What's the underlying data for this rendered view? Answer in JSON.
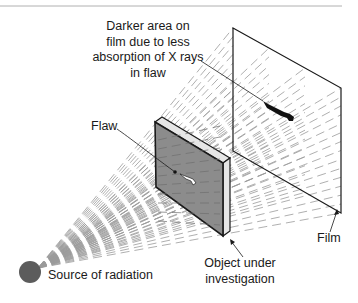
{
  "diagram": {
    "type": "radiography-schematic",
    "labels": {
      "darker_area": [
        "Darker area on",
        "film due to less",
        "absorption of X rays",
        "in flaw"
      ],
      "flaw": "Flaw",
      "film": "Film",
      "object": [
        "Object under",
        "investigation"
      ],
      "source": "Source of radiation"
    },
    "colors": {
      "line": "#1a1a1a",
      "ray": "#9a9a9a",
      "object_front": "#8c8c8c",
      "object_edge": "#e6e6e6",
      "source": "#5c5c5c",
      "rule": "#b0b0b0",
      "shadow": "#111111"
    },
    "geometry": {
      "source_center": [
        30,
        272
      ],
      "source_radius": 11,
      "film_corners": [
        [
          233,
          28
        ],
        [
          341,
          88
        ],
        [
          341,
          213
        ],
        [
          233,
          151
        ]
      ],
      "object_front_corners": [
        [
          155,
          122
        ],
        [
          223,
          163
        ],
        [
          223,
          236
        ],
        [
          156,
          187
        ]
      ],
      "object_depth_offset": [
        7,
        -5
      ]
    }
  }
}
